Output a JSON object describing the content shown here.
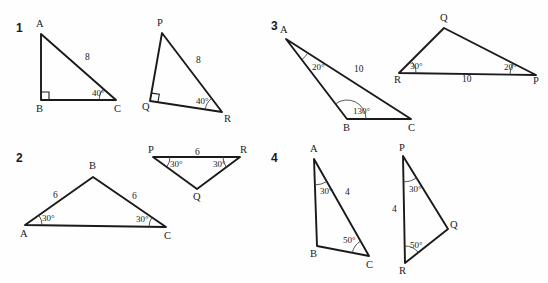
{
  "worksheet": {
    "background_color": "#fefefe",
    "ink_color": "#1a1a1a",
    "problems": [
      {
        "number": "1",
        "number_pos": [
          16,
          22
        ],
        "triangles": [
          {
            "name": "triangle-abc",
            "vertices": [
              {
                "label": "A",
                "x": 41,
                "y": 34,
                "lx": 36,
                "ly": 27
              },
              {
                "label": "B",
                "x": 41,
                "y": 100,
                "lx": 36,
                "ly": 112
              },
              {
                "label": "C",
                "x": 116,
                "y": 100,
                "lx": 114,
                "ly": 112
              }
            ],
            "sides": [
              {
                "label": "8",
                "lx": 85,
                "ly": 60
              }
            ],
            "angles": [
              {
                "label": "40°",
                "lx": 92,
                "ly": 96,
                "at": "C"
              }
            ],
            "right_angle_at": "B"
          },
          {
            "name": "triangle-pqr",
            "vertices": [
              {
                "label": "P",
                "x": 162,
                "y": 33,
                "lx": 157,
                "ly": 26
              },
              {
                "label": "Q",
                "x": 150,
                "y": 101,
                "lx": 142,
                "ly": 110
              },
              {
                "label": "R",
                "x": 222,
                "y": 112,
                "lx": 224,
                "ly": 122
              }
            ],
            "sides": [
              {
                "label": "8",
                "lx": 196,
                "ly": 63
              }
            ],
            "angles": [
              {
                "label": "40°",
                "lx": 196,
                "ly": 104,
                "at": "R"
              }
            ],
            "right_angle_at": "Q"
          }
        ]
      },
      {
        "number": "2",
        "number_pos": [
          16,
          152
        ],
        "triangles": [
          {
            "name": "triangle-abc",
            "vertices": [
              {
                "label": "A",
                "x": 25,
                "y": 225,
                "lx": 20,
                "ly": 237
              },
              {
                "label": "B",
                "x": 93,
                "y": 177,
                "lx": 89,
                "ly": 169
              },
              {
                "label": "C",
                "x": 166,
                "y": 227,
                "lx": 164,
                "ly": 239
              }
            ],
            "sides": [
              {
                "label": "6",
                "lx": 53,
                "ly": 198
              },
              {
                "label": "6",
                "lx": 132,
                "ly": 199
              }
            ],
            "angles": [
              {
                "label": "30°",
                "lx": 42,
                "ly": 221,
                "at": "A"
              },
              {
                "label": "30°",
                "lx": 136,
                "ly": 222,
                "at": "C"
              }
            ],
            "right_angle_at": null
          },
          {
            "name": "triangle-pqr",
            "vertices": [
              {
                "label": "P",
                "x": 153,
                "y": 157,
                "lx": 148,
                "ly": 153
              },
              {
                "label": "R",
                "x": 240,
                "y": 157,
                "lx": 240,
                "ly": 153
              },
              {
                "label": "Q",
                "x": 197,
                "y": 189,
                "lx": 193,
                "ly": 200
              }
            ],
            "sides": [
              {
                "label": "6",
                "lx": 195,
                "ly": 155
              }
            ],
            "angles": [
              {
                "label": "30°",
                "lx": 170,
                "ly": 167,
                "at": "P"
              },
              {
                "label": "30°",
                "lx": 213,
                "ly": 167,
                "at": "R"
              }
            ],
            "right_angle_at": null
          }
        ]
      },
      {
        "number": "3",
        "number_pos": [
          271,
          20
        ],
        "triangles": [
          {
            "name": "triangle-abc",
            "vertices": [
              {
                "label": "A",
                "x": 286,
                "y": 39,
                "lx": 280,
                "ly": 33
              },
              {
                "label": "B",
                "x": 347,
                "y": 119,
                "lx": 343,
                "ly": 131
              },
              {
                "label": "C",
                "x": 411,
                "y": 119,
                "lx": 408,
                "ly": 131
              }
            ],
            "sides": [
              {
                "label": "10",
                "lx": 354,
                "ly": 72
              }
            ],
            "angles": [
              {
                "label": "20°",
                "lx": 312,
                "ly": 70,
                "at": "A"
              },
              {
                "label": "130°",
                "lx": 353,
                "ly": 114,
                "at": "B"
              }
            ],
            "right_angle_at": null
          },
          {
            "name": "triangle-rqp",
            "vertices": [
              {
                "label": "R",
                "x": 399,
                "y": 73,
                "lx": 394,
                "ly": 83
              },
              {
                "label": "Q",
                "x": 444,
                "y": 28,
                "lx": 440,
                "ly": 21
              },
              {
                "label": "P",
                "x": 536,
                "y": 75,
                "lx": 533,
                "ly": 84
              }
            ],
            "sides": [
              {
                "label": "10",
                "lx": 462,
                "ly": 82
              }
            ],
            "angles": [
              {
                "label": "30°",
                "lx": 410,
                "ly": 69,
                "at": "R"
              },
              {
                "label": "20°",
                "lx": 504,
                "ly": 70,
                "at": "P"
              }
            ],
            "right_angle_at": null
          }
        ]
      },
      {
        "number": "4",
        "number_pos": [
          271,
          152
        ],
        "triangles": [
          {
            "name": "triangle-abc",
            "vertices": [
              {
                "label": "A",
                "x": 314,
                "y": 159,
                "lx": 310,
                "ly": 152
              },
              {
                "label": "B",
                "x": 317,
                "y": 246,
                "lx": 310,
                "ly": 257
              },
              {
                "label": "C",
                "x": 369,
                "y": 256,
                "lx": 366,
                "ly": 268
              }
            ],
            "sides": [
              {
                "label": "4",
                "lx": 345,
                "ly": 195
              }
            ],
            "angles": [
              {
                "label": "30°",
                "lx": 320,
                "ly": 194,
                "at": "A"
              },
              {
                "label": "50°",
                "lx": 343,
                "ly": 243,
                "at": "C"
              }
            ],
            "right_angle_at": null
          },
          {
            "name": "triangle-pqr",
            "vertices": [
              {
                "label": "P",
                "x": 403,
                "y": 156,
                "lx": 399,
                "ly": 151
              },
              {
                "label": "Q",
                "x": 448,
                "y": 229,
                "lx": 450,
                "ly": 228
              },
              {
                "label": "R",
                "x": 405,
                "y": 263,
                "lx": 399,
                "ly": 274
              }
            ],
            "sides": [
              {
                "label": "4",
                "lx": 392,
                "ly": 212
              }
            ],
            "angles": [
              {
                "label": "30°",
                "lx": 409,
                "ly": 192,
                "at": "P"
              },
              {
                "label": "50°",
                "lx": 410,
                "ly": 248,
                "at": "R"
              }
            ],
            "right_angle_at": null
          }
        ]
      }
    ]
  }
}
